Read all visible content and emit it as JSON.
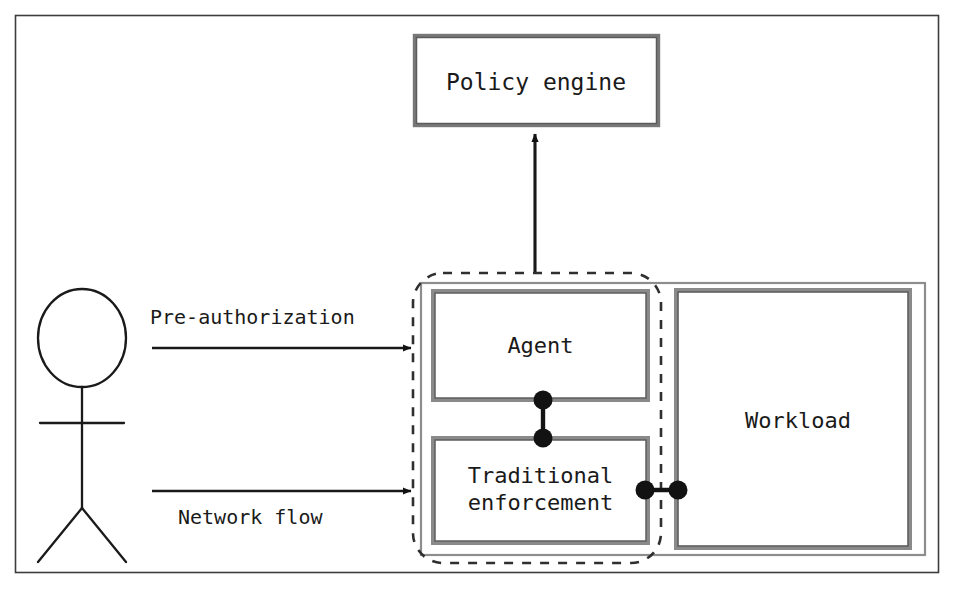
{
  "diagram": {
    "type": "architecture-diagram",
    "colors": {
      "frame": "#3a3a3a",
      "box_border": "#6e6e6e",
      "box_border_dark": "#4a4a4a",
      "dashed_boundary": "#3a3a3a",
      "arrow": "#1a1a1a",
      "connector_dot": "#111111",
      "text": "#1a1a1a",
      "background": "#ffffff"
    },
    "nodes": {
      "policy_engine": {
        "label": "Policy engine"
      },
      "agent": {
        "label": "Agent"
      },
      "traditional_enforcement": {
        "label": "Traditional\nenforcement"
      },
      "workload": {
        "label": "Workload"
      },
      "actor": {
        "label": "",
        "shape": "stick-figure"
      },
      "enforcement_boundary": {
        "label": "",
        "shape": "dashed-rounded-rect"
      }
    },
    "edges": [
      {
        "name": "pre-authorization",
        "label": "Pre-authorization",
        "from": "actor",
        "to": "enforcement_boundary",
        "style": "solid-arrow"
      },
      {
        "name": "network-flow",
        "label": "Network flow",
        "from": "actor",
        "to": "enforcement_boundary",
        "style": "solid-arrow"
      },
      {
        "name": "agent-to-policy-engine",
        "label": "",
        "from": "agent",
        "to": "policy_engine",
        "style": "solid-arrow-up"
      },
      {
        "name": "agent-to-traditional-enforcement",
        "label": "",
        "from": "agent",
        "to": "traditional_enforcement",
        "style": "ball-and-socket"
      },
      {
        "name": "traditional-enforcement-to-workload",
        "label": "",
        "from": "traditional_enforcement",
        "to": "workload",
        "style": "ball-and-socket"
      }
    ]
  }
}
